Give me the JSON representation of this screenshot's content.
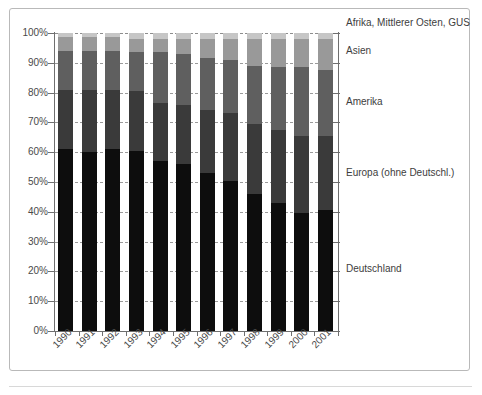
{
  "chart_data": {
    "type": "bar",
    "subtype": "stacked-100-percent",
    "title": "",
    "xlabel": "",
    "ylabel": "",
    "ylim": [
      0,
      100
    ],
    "ytick_labels": [
      "0%",
      "10%",
      "20%",
      "30%",
      "40%",
      "50%",
      "60%",
      "70%",
      "80%",
      "90%",
      "100%"
    ],
    "ytick_values": [
      0,
      10,
      20,
      30,
      40,
      50,
      60,
      70,
      80,
      90,
      100
    ],
    "grid": true,
    "legend_position": "right-inline",
    "categories": [
      "1990",
      "1991",
      "1992",
      "1993",
      "1994",
      "1995",
      "1996",
      "1997",
      "1998",
      "1999",
      "2000",
      "2001"
    ],
    "series": [
      {
        "name": "Deutschland",
        "color": "#0d0d0d",
        "values": [
          61.0,
          60.0,
          61.0,
          60.5,
          57.0,
          56.0,
          53.0,
          50.5,
          46.0,
          43.0,
          39.5,
          40.5
        ]
      },
      {
        "name": "Europa (ohne Deutschl.)",
        "color": "#3a3a3a",
        "values": [
          20.0,
          21.0,
          20.0,
          20.0,
          19.5,
          20.0,
          21.0,
          22.5,
          23.5,
          24.5,
          26.0,
          25.0
        ]
      },
      {
        "name": "Amerika",
        "color": "#5f5f5f",
        "values": [
          13.0,
          13.0,
          13.0,
          13.0,
          17.0,
          17.0,
          17.5,
          18.0,
          19.5,
          21.0,
          23.0,
          22.0
        ]
      },
      {
        "name": "Asien",
        "color": "#999999",
        "values": [
          4.5,
          4.5,
          4.5,
          4.5,
          4.5,
          5.0,
          6.5,
          7.0,
          9.0,
          9.5,
          9.5,
          10.5
        ]
      },
      {
        "name": "Afrika, Mittlerer Osten, GUS",
        "color": "#c6c6c6",
        "values": [
          1.5,
          1.5,
          1.5,
          2.0,
          2.0,
          2.0,
          2.0,
          2.0,
          2.0,
          2.0,
          2.0,
          2.0
        ]
      }
    ],
    "cumulative_tops": {
      "Deutschland": [
        61.0,
        60.0,
        61.0,
        60.5,
        57.0,
        56.0,
        53.0,
        50.5,
        46.0,
        43.0,
        39.5,
        40.5
      ],
      "Europa (ohne Deutschl.)": [
        81.0,
        81.0,
        81.0,
        80.5,
        76.5,
        76.0,
        74.0,
        73.0,
        69.5,
        67.5,
        65.5,
        65.5
      ],
      "Amerika": [
        94.0,
        94.0,
        94.0,
        93.5,
        93.5,
        93.0,
        91.5,
        91.0,
        89.0,
        88.5,
        88.5,
        87.5
      ],
      "Asien": [
        98.5,
        98.5,
        98.5,
        98.0,
        98.0,
        98.0,
        98.0,
        98.0,
        98.0,
        98.0,
        98.0,
        98.0
      ],
      "Afrika, Mittlerer Osten, GUS": [
        100.0,
        100.0,
        100.0,
        100.0,
        100.0,
        100.0,
        100.0,
        100.0,
        100.0,
        100.0,
        100.0,
        100.0
      ]
    }
  },
  "legend": {
    "items": [
      {
        "label": "Afrika, Mittlerer Osten, GUS",
        "top_px": 18
      },
      {
        "label": "Asien",
        "top_px": 46
      },
      {
        "label": "Amerika",
        "top_px": 97
      },
      {
        "label": "Europa (ohne Deutschl.)",
        "top_px": 168
      },
      {
        "label": "Deutschland",
        "top_px": 264
      }
    ]
  }
}
